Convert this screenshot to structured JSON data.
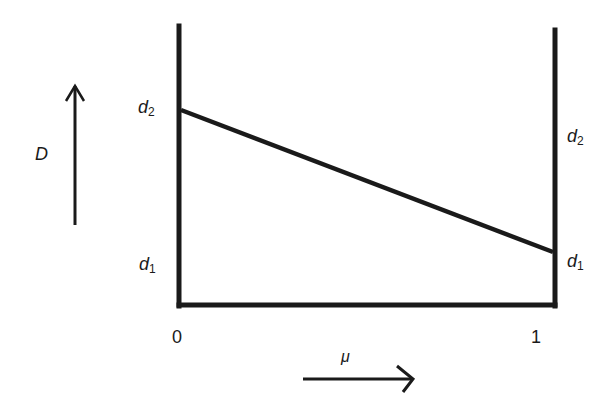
{
  "diagram": {
    "y_axis_label": "D",
    "x_axis_label": "μ",
    "left_axis": {
      "x_value": "0",
      "upper_label": {
        "base": "d",
        "sub": "2"
      },
      "lower_label": {
        "base": "d",
        "sub": "1"
      }
    },
    "right_axis": {
      "x_value": "1",
      "upper_label": {
        "base": "d",
        "sub": "2"
      },
      "lower_label": {
        "base": "d",
        "sub": "1"
      }
    },
    "line": {
      "description": "Linear decrease of D from d2 at μ=0 to d1 at μ=1",
      "start": {
        "mu": 0,
        "D": "d2"
      },
      "end": {
        "mu": 1,
        "D": "d1"
      }
    },
    "colors": {
      "ink": "#1a1a1a",
      "background": "#ffffff"
    }
  }
}
